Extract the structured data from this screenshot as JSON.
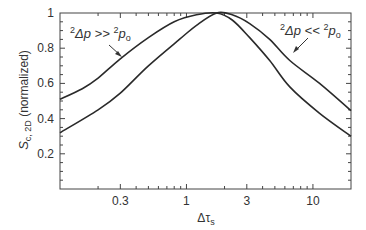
{
  "chart_data": {
    "type": "line",
    "title": "",
    "xlabel": "Δτs",
    "xlabel_main": "Δτ",
    "xlabel_sub": "s",
    "ylabel": "S_c,2D (normalized)",
    "ylabel_main": "S",
    "ylabel_sub": "c, 2D",
    "ylabel_rest": " (normalized)",
    "xscale": "log",
    "xlim": [
      0.1,
      20
    ],
    "ylim": [
      0,
      1
    ],
    "grid": false,
    "legend": "none (inline annotations)",
    "x_ticks": [
      {
        "value": 0.3,
        "label": "0.3"
      },
      {
        "value": 1,
        "label": "1"
      },
      {
        "value": 3,
        "label": "3"
      },
      {
        "value": 10,
        "label": "10"
      }
    ],
    "y_ticks": [
      {
        "value": 0.2,
        "label": "0.2"
      },
      {
        "value": 0.4,
        "label": "0.4"
      },
      {
        "value": 0.6,
        "label": "0.6"
      },
      {
        "value": 0.8,
        "label": "0.8"
      },
      {
        "value": 1,
        "label": "1"
      }
    ],
    "series": [
      {
        "name": "²Δp >> ²p₀",
        "x": [
          0.1,
          0.15,
          0.2,
          0.3,
          0.5,
          0.8,
          1.2,
          1.73,
          2.3,
          3.16,
          4.55,
          6.56,
          11.3,
          20
        ],
        "values": [
          0.51,
          0.57,
          0.63,
          0.74,
          0.86,
          0.95,
          0.99,
          1.0,
          0.96,
          0.86,
          0.73,
          0.58,
          0.43,
          0.3
        ]
      },
      {
        "name": "²Δp << ²p₀",
        "x": [
          0.1,
          0.2,
          0.3,
          0.5,
          0.88,
          1.2,
          1.73,
          2.3,
          3.16,
          4.55,
          6.56,
          11.3,
          20
        ],
        "values": [
          0.32,
          0.45,
          0.545,
          0.7,
          0.85,
          0.93,
          1.0,
          0.99,
          0.94,
          0.85,
          0.73,
          0.6,
          0.445
        ]
      }
    ],
    "annotations": [
      {
        "text_pre": "2",
        "text_mid": "Δp >> ",
        "text_sup2": "2",
        "text_end": "p",
        "text_sub": "o",
        "points_to": "²Δp >> ²p₀"
      },
      {
        "text_pre": "2",
        "text_mid": "Δp << ",
        "text_sup2": "2",
        "text_end": "p",
        "text_sub": "o",
        "points_to": "²Δp << ²p₀"
      }
    ],
    "line_color": "#2a2a2a",
    "axis_color": "#444444"
  }
}
